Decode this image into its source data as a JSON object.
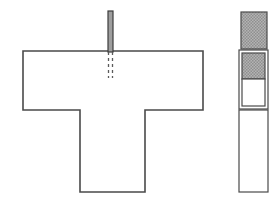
{
  "document": {
    "title": "Technical cross-section line drawing",
    "background_color": "#ffffff",
    "width": 280,
    "height": 205
  },
  "style": {
    "outline_color": "#4a4a4a",
    "outline_color_dark": "#3c3c3c",
    "hatch_fill_color": "#a8a8a8",
    "hatch_line_color": "#8c8c8c",
    "white_fill": "#ffffff",
    "stroke_width": 1.6,
    "thin_stroke_width": 1.2,
    "dash_pattern": "3 3"
  },
  "left_assembly": {
    "name": "T-shaped section with vertical post",
    "post": {
      "label": "vertical post",
      "x": 108,
      "y": 11,
      "width": 5,
      "height": 41,
      "fill": "#9e9e9e"
    },
    "hidden_line_left": {
      "label": "hidden edge left",
      "x": 108.5,
      "y1": 52,
      "y2": 78
    },
    "hidden_line_right": {
      "label": "hidden edge right",
      "x": 112.5,
      "y1": 52,
      "y2": 78
    },
    "t_profile": {
      "label": "T profile outline",
      "points": "23,51 203,51 203,110 145,110 145,192 80,192 80,110 23,110 23,51",
      "fill": "#ffffff"
    }
  },
  "right_assembly": {
    "name": "Vertical segmented strip",
    "segments": [
      {
        "id": "segment-top-hatched",
        "label": "top hatched block",
        "x": 241,
        "y": 12,
        "width": 26,
        "height": 37,
        "fill": "hatch",
        "outlined": true
      },
      {
        "id": "segment-outer-box",
        "label": "middle outer box",
        "x": 239,
        "y": 50,
        "width": 29,
        "height": 59,
        "fill": "white",
        "outlined": true
      },
      {
        "id": "segment-inner-hatched",
        "label": "middle inner hatched block",
        "x": 242,
        "y": 53,
        "width": 23,
        "height": 26,
        "fill": "hatch",
        "outlined": true
      },
      {
        "id": "segment-inner-white",
        "label": "middle inner white block",
        "x": 242,
        "y": 79,
        "width": 23,
        "height": 27,
        "fill": "white",
        "outlined": true
      },
      {
        "id": "segment-bottom-white",
        "label": "bottom white block",
        "x": 239,
        "y": 110,
        "width": 29,
        "height": 82,
        "fill": "white",
        "outlined": true
      }
    ]
  }
}
